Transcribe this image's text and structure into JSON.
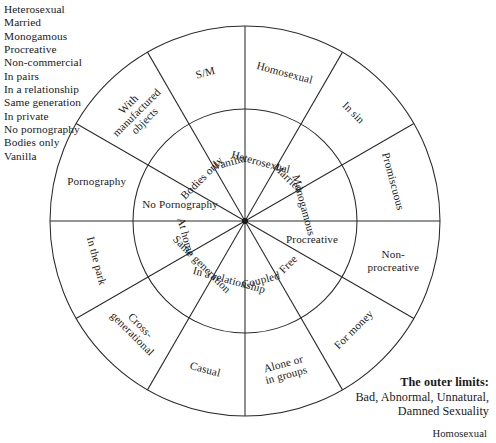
{
  "charmed_circle_list": {
    "items": [
      "Heterosexual",
      "Married",
      "Monogamous",
      "Procreative",
      "Non-commercial",
      "In pairs",
      "In a relationship",
      "Same generation",
      "In private",
      "No pornography",
      "Bodies only",
      "Vanilla"
    ]
  },
  "diagram": {
    "center": {
      "x": 245,
      "y": 221
    },
    "outer_radius": 195,
    "inner_radius": 112,
    "segment_count": 12,
    "stroke_color": "#2a2a2a",
    "inner_ring_labels": [
      "Heterosexual",
      "Married",
      "Monogamous",
      "Procreative",
      "Free",
      "Coupled",
      "In a relationship",
      "Same generation",
      "At home",
      "No Pornography",
      "Bodies only",
      "Vanilla"
    ],
    "outer_ring_labels": [
      "Homosexual",
      "In sin",
      "Promiscuous",
      "Non-procreative",
      "For money",
      "Alone or in groups",
      "Casual",
      "Cross-generational",
      "In the park",
      "Pornography",
      "With manufactured objects",
      "S/M"
    ],
    "outer_ring_labels_lines": [
      [
        "Homosexual"
      ],
      [
        "In sin"
      ],
      [
        "Promiscuous"
      ],
      [
        "Non-",
        "procreative"
      ],
      [
        "For money"
      ],
      [
        "Alone or",
        "in groups"
      ],
      [
        "Casual"
      ],
      [
        "Cross-",
        "generational"
      ],
      [
        "In the park"
      ],
      [
        "Pornography"
      ],
      [
        "With",
        "manufactured",
        "objects"
      ],
      [
        "S/M"
      ]
    ]
  },
  "caption": {
    "title": "The outer limits:",
    "line1": "Bad, Abnormal, Unnatural,",
    "line2": "Damned Sexuality"
  },
  "bottom_note": {
    "text": "Homosexual"
  }
}
